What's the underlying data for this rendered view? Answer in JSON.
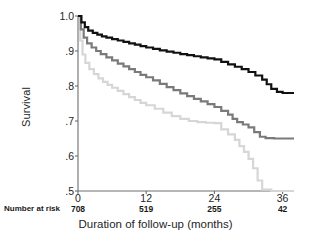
{
  "chart_data": {
    "type": "line",
    "title": "",
    "xlabel": "Duration of follow-up (months)",
    "ylabel": "Survival",
    "xlim": [
      0,
      38
    ],
    "ylim": [
      0.5,
      1.0
    ],
    "grid": false,
    "legend": "none",
    "x_ticks": [
      0,
      12,
      24,
      36
    ],
    "x_tick_labels": [
      "0",
      "12",
      "24",
      "36"
    ],
    "y_ticks": [
      1.0,
      0.9,
      0.8,
      0.7,
      0.6,
      0.5
    ],
    "y_tick_labels": [
      "1.0",
      ".9",
      ".8",
      ".7",
      ".6",
      ".5"
    ],
    "risk_label": "Number at risk",
    "numbers_at_risk": [
      708,
      519,
      255,
      42
    ],
    "series": [
      {
        "name": "upper-curve",
        "color": "#111111",
        "step": true,
        "points": [
          [
            0,
            1.0
          ],
          [
            0.6,
            0.982
          ],
          [
            1.2,
            0.968
          ],
          [
            1.8,
            0.958
          ],
          [
            2.6,
            0.952
          ],
          [
            3.4,
            0.947
          ],
          [
            4.2,
            0.942
          ],
          [
            5.0,
            0.938
          ],
          [
            6.0,
            0.934
          ],
          [
            7.0,
            0.93
          ],
          [
            8.0,
            0.926
          ],
          [
            9.0,
            0.922
          ],
          [
            10.0,
            0.918
          ],
          [
            11.0,
            0.914
          ],
          [
            12.0,
            0.91
          ],
          [
            13.2,
            0.906
          ],
          [
            14.4,
            0.902
          ],
          [
            15.6,
            0.898
          ],
          [
            16.8,
            0.895
          ],
          [
            18.0,
            0.891
          ],
          [
            19.2,
            0.888
          ],
          [
            20.4,
            0.885
          ],
          [
            21.6,
            0.882
          ],
          [
            22.8,
            0.879
          ],
          [
            24.0,
            0.876
          ],
          [
            25.2,
            0.869
          ],
          [
            26.4,
            0.862
          ],
          [
            27.6,
            0.855
          ],
          [
            28.8,
            0.848
          ],
          [
            30.0,
            0.84
          ],
          [
            31.2,
            0.83
          ],
          [
            32.4,
            0.818
          ],
          [
            33.2,
            0.805
          ],
          [
            34.0,
            0.792
          ],
          [
            35.0,
            0.783
          ],
          [
            36.0,
            0.78
          ],
          [
            38.0,
            0.78
          ]
        ]
      },
      {
        "name": "middle-curve",
        "color": "#7a7a7a",
        "step": true,
        "points": [
          [
            0,
            1.0
          ],
          [
            0.5,
            0.962
          ],
          [
            1.0,
            0.938
          ],
          [
            1.6,
            0.922
          ],
          [
            2.4,
            0.91
          ],
          [
            3.2,
            0.9
          ],
          [
            4.0,
            0.891
          ],
          [
            5.0,
            0.882
          ],
          [
            6.0,
            0.873
          ],
          [
            7.0,
            0.864
          ],
          [
            8.0,
            0.856
          ],
          [
            9.0,
            0.848
          ],
          [
            10.0,
            0.84
          ],
          [
            11.0,
            0.832
          ],
          [
            12.0,
            0.825
          ],
          [
            13.2,
            0.816
          ],
          [
            14.4,
            0.806
          ],
          [
            15.6,
            0.797
          ],
          [
            16.8,
            0.788
          ],
          [
            18.0,
            0.779
          ],
          [
            19.2,
            0.771
          ],
          [
            20.4,
            0.763
          ],
          [
            21.6,
            0.756
          ],
          [
            22.8,
            0.748
          ],
          [
            24.0,
            0.74
          ],
          [
            25.2,
            0.729
          ],
          [
            26.4,
            0.718
          ],
          [
            27.2,
            0.706
          ],
          [
            28.0,
            0.697
          ],
          [
            29.0,
            0.69
          ],
          [
            30.0,
            0.682
          ],
          [
            31.0,
            0.668
          ],
          [
            32.0,
            0.655
          ],
          [
            33.0,
            0.651
          ],
          [
            34.5,
            0.65
          ],
          [
            36.0,
            0.65
          ],
          [
            38.0,
            0.65
          ]
        ]
      },
      {
        "name": "lower-curve",
        "color": "#d6d6d6",
        "step": true,
        "points": [
          [
            0,
            1.0
          ],
          [
            0.4,
            0.93
          ],
          [
            0.8,
            0.89
          ],
          [
            1.3,
            0.866
          ],
          [
            2.0,
            0.848
          ],
          [
            2.8,
            0.834
          ],
          [
            3.6,
            0.822
          ],
          [
            4.4,
            0.812
          ],
          [
            5.2,
            0.803
          ],
          [
            6.0,
            0.795
          ],
          [
            7.0,
            0.786
          ],
          [
            8.0,
            0.777
          ],
          [
            9.0,
            0.768
          ],
          [
            10.0,
            0.76
          ],
          [
            11.0,
            0.752
          ],
          [
            12.0,
            0.745
          ],
          [
            13.5,
            0.735
          ],
          [
            15.0,
            0.724
          ],
          [
            16.5,
            0.714
          ],
          [
            18.0,
            0.706
          ],
          [
            19.5,
            0.7
          ],
          [
            21.0,
            0.697
          ],
          [
            22.5,
            0.695
          ],
          [
            24.0,
            0.694
          ],
          [
            25.2,
            0.676
          ],
          [
            26.4,
            0.662
          ],
          [
            27.6,
            0.646
          ],
          [
            28.4,
            0.628
          ],
          [
            29.2,
            0.612
          ],
          [
            30.0,
            0.592
          ],
          [
            30.8,
            0.565
          ],
          [
            31.6,
            0.53
          ],
          [
            32.4,
            0.504
          ],
          [
            34.0,
            0.5
          ],
          [
            36.0,
            0.5
          ],
          [
            38.0,
            0.5
          ]
        ]
      }
    ]
  }
}
